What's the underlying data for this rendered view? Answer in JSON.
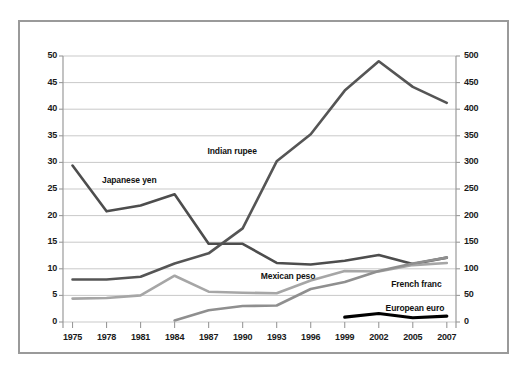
{
  "chart_data": {
    "type": "line",
    "title": "",
    "subtitle": "",
    "xlabel": "",
    "ylabel": "",
    "y2label": "",
    "grid": true,
    "legend_position": "inline-labels",
    "x": [
      1975,
      1978,
      1981,
      1984,
      1987,
      1990,
      1993,
      1996,
      1999,
      2002,
      2005,
      2007
    ],
    "xtick_labels": [
      "1975",
      "1978",
      "1981",
      "1984",
      "1987",
      "1990",
      "1993",
      "1996",
      "1999",
      "2002",
      "2005",
      "2007"
    ],
    "ylim": [
      0,
      50
    ],
    "ytick_labels": [
      "0",
      "5",
      "10",
      "15",
      "20",
      "25",
      "30",
      "35",
      "40",
      "45",
      "50"
    ],
    "yticks": [
      0,
      5,
      10,
      15,
      20,
      25,
      30,
      35,
      40,
      45,
      50
    ],
    "y2lim": [
      0,
      500
    ],
    "y2tick_labels": [
      "0",
      "50",
      "100",
      "150",
      "200",
      "250",
      "300",
      "350",
      "400",
      "450",
      "500"
    ],
    "y2ticks": [
      0,
      50,
      100,
      150,
      200,
      250,
      300,
      350,
      400,
      450,
      500
    ],
    "series": [
      {
        "name": "Japanese yen",
        "color": "#4d4d4d",
        "width": 2.6,
        "axis": "left",
        "label_x": 1977.6,
        "label_y": 26.6,
        "x": [
          1975,
          1978,
          1981,
          1984,
          1987,
          1990,
          1993,
          1996,
          1999,
          2002,
          2005,
          2007
        ],
        "values": [
          29.4,
          20.8,
          21.9,
          24.0,
          14.7,
          14.7,
          11.1,
          10.8,
          11.5,
          12.6,
          10.9,
          12.1
        ]
      },
      {
        "name": "Indian rupee",
        "color": "#555555",
        "width": 2.6,
        "axis": "left",
        "label_x": 1986.9,
        "label_y": 32.1,
        "x": [
          1975,
          1978,
          1981,
          1984,
          1987,
          1990,
          1993,
          1996,
          1999,
          2002,
          2005,
          2007
        ],
        "values": [
          8.0,
          8.0,
          8.5,
          11.0,
          12.9,
          17.6,
          30.2,
          35.3,
          43.5,
          49.0,
          44.2,
          41.2
        ]
      },
      {
        "name": "Mexican peso",
        "color": "#a6a6a6",
        "width": 2.6,
        "axis": "left",
        "label_x": 1991.6,
        "label_y": 8.6,
        "x": [
          1975,
          1978,
          1981,
          1984,
          1987,
          1990,
          1993,
          1996,
          1999,
          2002,
          2005,
          2007
        ],
        "values": [
          4.4,
          4.5,
          5.0,
          8.7,
          5.7,
          5.5,
          5.4,
          7.8,
          9.6,
          9.5,
          10.7,
          11.1
        ]
      },
      {
        "name": "French franc",
        "color": "#8f8f8f",
        "width": 2.6,
        "axis": "left",
        "label_x": 2003.1,
        "label_y": 7.2,
        "x": [
          1984,
          1987,
          1990,
          1993,
          1996,
          1999,
          2002,
          2005,
          2007
        ],
        "values": [
          0.3,
          2.2,
          3.0,
          3.1,
          6.2,
          7.5,
          9.6,
          11.0,
          12.1
        ]
      },
      {
        "name": "European euro",
        "color": "#000000",
        "width": 3.2,
        "axis": "left",
        "label_x": 2002.6,
        "label_y": 2.7,
        "x": [
          1999,
          2002,
          2005,
          2007
        ],
        "values": [
          0.9,
          1.6,
          0.8,
          1.1
        ]
      }
    ]
  },
  "plot": {
    "left": 63,
    "right": 456,
    "top": 56,
    "bottom": 322,
    "grid_color": "#c9c9c9",
    "axis_color": "#9a9a9a",
    "frame_color": "#9a9a9a",
    "background": "#ffffff"
  }
}
